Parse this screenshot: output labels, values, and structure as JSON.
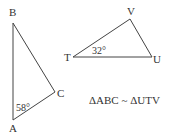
{
  "diagram": {
    "triangle_abc": {
      "vertices": {
        "A": {
          "label": "A",
          "x": 13,
          "y": 120
        },
        "B": {
          "label": "B",
          "x": 13,
          "y": 23
        },
        "C": {
          "label": "C",
          "x": 55,
          "y": 92
        }
      },
      "angle_label": "58°",
      "angle_at": "A"
    },
    "triangle_tuv": {
      "vertices": {
        "T": {
          "label": "T",
          "x": 73,
          "y": 57
        },
        "U": {
          "label": "U",
          "x": 152,
          "y": 57
        },
        "V": {
          "label": "V",
          "x": 130,
          "y": 19
        }
      },
      "angle_label": "32°",
      "angle_at": "T"
    },
    "similarity_statement": "ΔABC ~ ΔUTV",
    "colors": {
      "stroke": "#444444",
      "text": "#333333"
    }
  }
}
